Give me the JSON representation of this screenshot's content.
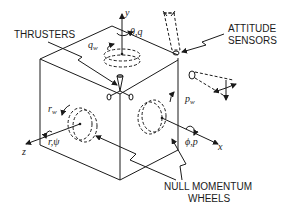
{
  "diagram": {
    "type": "spacecraft attitude control schematic",
    "labels": {
      "thrusters": "THRUSTERS",
      "attitude_sensors_line1": "ATTITUDE",
      "attitude_sensors_line2": "SENSORS",
      "null_momentum_line1": "NULL MOMENTUM",
      "null_momentum_line2": "WHEELS"
    },
    "axes": {
      "x": "x",
      "y": "y",
      "z": "z"
    },
    "rotations": {
      "pitch": "θ,q",
      "roll": "ϕ,p",
      "yaw": "r,ψ"
    },
    "wheel_rates": {
      "pitch_wheel": "q",
      "roll_wheel": "p",
      "yaw_wheel": "r",
      "subscript": "w"
    }
  }
}
